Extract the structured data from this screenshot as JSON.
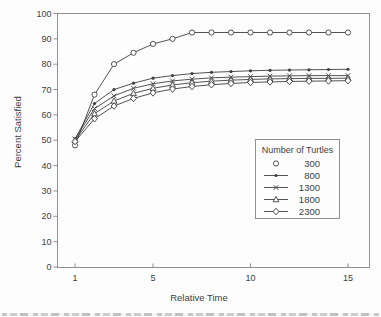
{
  "chart_data": {
    "type": "line",
    "title": "",
    "xlabel": "Relative Time",
    "ylabel": "Percent Satisfied",
    "x": [
      1,
      2,
      3,
      4,
      5,
      6,
      7,
      8,
      9,
      10,
      11,
      12,
      13,
      14,
      15
    ],
    "x_ticks": [
      1,
      5,
      10,
      15
    ],
    "y_ticks": [
      0,
      10,
      20,
      30,
      40,
      50,
      60,
      70,
      80,
      90,
      100
    ],
    "xlim": [
      0,
      16
    ],
    "ylim": [
      0,
      100
    ],
    "grid": false,
    "line_color": "#3f3f3f",
    "axis_color": "#8f8f8f",
    "legend": {
      "title": "Number of Turtles",
      "position": "inside-lower-right"
    },
    "series": [
      {
        "name": "300",
        "marker": "circle-open",
        "legend_line": false,
        "values": [
          48,
          68,
          80,
          84.5,
          88,
          90,
          92.5,
          92.5,
          92.5,
          92.5,
          92.5,
          92.5,
          92.5,
          92.5,
          92.5
        ]
      },
      {
        "name": "800",
        "marker": "dot-filled",
        "legend_line": true,
        "values": [
          50.5,
          64.5,
          70,
          72.5,
          74.5,
          75.5,
          76.3,
          76.8,
          77.1,
          77.4,
          77.6,
          77.7,
          77.8,
          77.9,
          78
        ]
      },
      {
        "name": "1300",
        "marker": "x-cross",
        "legend_line": true,
        "values": [
          50.5,
          62.5,
          67.5,
          70.5,
          72.3,
          73.4,
          74.1,
          74.6,
          74.9,
          75.1,
          75.3,
          75.4,
          75.5,
          75.5,
          75.5
        ]
      },
      {
        "name": "1800",
        "marker": "triangle-open",
        "legend_line": true,
        "values": [
          50,
          60.5,
          65.5,
          68.5,
          70.5,
          71.8,
          72.7,
          73.3,
          73.7,
          74,
          74.2,
          74.3,
          74.4,
          74.4,
          74.5
        ]
      },
      {
        "name": "2300",
        "marker": "diamond-open",
        "legend_line": true,
        "values": [
          49.5,
          58.5,
          63.5,
          66.5,
          68.7,
          70.2,
          71.2,
          71.9,
          72.4,
          72.8,
          73,
          73.2,
          73.3,
          73.4,
          73.5
        ]
      }
    ]
  }
}
